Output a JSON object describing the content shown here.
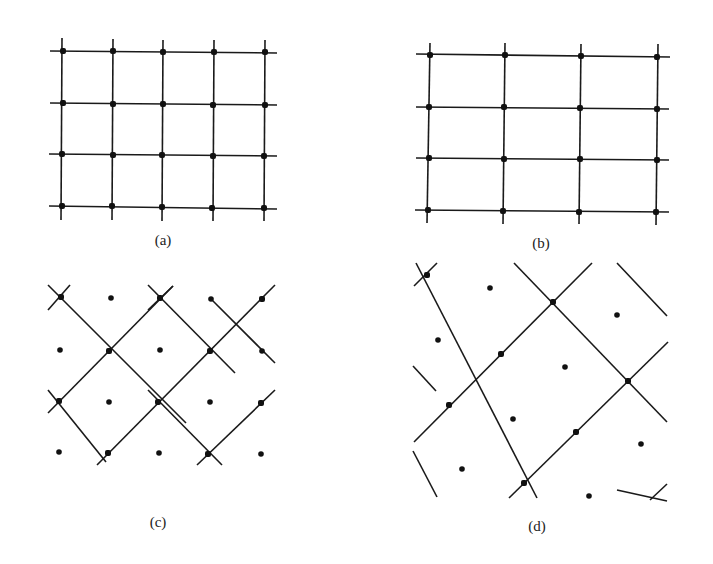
{
  "figure": {
    "background": "#ffffff",
    "ink_color": "#111111",
    "panels": [
      {
        "id": "a",
        "label": "(a)",
        "label_pos": [
          163,
          245
        ],
        "description": "Rectangular lattice, 5 columns x 4 rows",
        "lines": [
          [
            50,
            51,
            277,
            53
          ],
          [
            50,
            103,
            277,
            105
          ],
          [
            49,
            154,
            277,
            156
          ],
          [
            49,
            206,
            277,
            209
          ],
          [
            62,
            38,
            61,
            220
          ],
          [
            113,
            39,
            112,
            220
          ],
          [
            163,
            40,
            162,
            221
          ],
          [
            214,
            40,
            213,
            221
          ],
          [
            265,
            40,
            264,
            221
          ]
        ],
        "lattice_points": [
          [
            63,
            51
          ],
          [
            113,
            51
          ],
          [
            163,
            52
          ],
          [
            214,
            52
          ],
          [
            265,
            52
          ],
          [
            63,
            103
          ],
          [
            113,
            104
          ],
          [
            163,
            104
          ],
          [
            213,
            105
          ],
          [
            265,
            105
          ],
          [
            62,
            154
          ],
          [
            113,
            155
          ],
          [
            162,
            155
          ],
          [
            213,
            156
          ],
          [
            264,
            156
          ],
          [
            62,
            206
          ],
          [
            112,
            206
          ],
          [
            162,
            207
          ],
          [
            212,
            208
          ],
          [
            264,
            208
          ]
        ],
        "center_dots": []
      },
      {
        "id": "b",
        "label": "(b)",
        "label_pos": [
          541,
          248
        ],
        "description": "Rectangular lattice, 4 columns x 4 rows (wider cells)",
        "lines": [
          [
            416,
            54,
            670,
            57
          ],
          [
            416,
            107,
            669,
            109
          ],
          [
            416,
            158,
            669,
            160
          ],
          [
            415,
            210,
            669,
            212
          ],
          [
            430,
            43,
            427,
            223
          ],
          [
            505,
            43,
            503,
            224
          ],
          [
            581,
            44,
            579,
            224
          ],
          [
            658,
            44,
            656,
            225
          ]
        ],
        "lattice_points": [
          [
            430,
            55
          ],
          [
            505,
            55
          ],
          [
            581,
            56
          ],
          [
            657,
            57
          ],
          [
            429,
            107
          ],
          [
            504,
            107
          ],
          [
            580,
            108
          ],
          [
            657,
            109
          ],
          [
            429,
            158
          ],
          [
            504,
            159
          ],
          [
            580,
            159
          ],
          [
            657,
            160
          ],
          [
            428,
            210
          ],
          [
            503,
            211
          ],
          [
            579,
            212
          ],
          [
            656,
            212
          ]
        ],
        "center_dots": []
      },
      {
        "id": "c",
        "label": "(c)",
        "label_pos": [
          158,
          527
        ],
        "description": "Centered lattice: diagonal (rotated square) lattice with additional points at cell centers",
        "lines": [
          [
            48,
            285,
            186,
            423
          ],
          [
            148,
            285,
            235,
            373
          ],
          [
            210,
            298,
            275,
            363
          ],
          [
            48,
            390,
            106,
            462
          ],
          [
            148,
            390,
            222,
            465
          ],
          [
            48,
            310,
            70,
            285
          ],
          [
            48,
            413,
            173,
            286
          ],
          [
            97,
            465,
            275,
            285
          ],
          [
            197,
            465,
            275,
            390
          ],
          [
            148,
            310,
            173,
            286
          ]
        ],
        "lattice_points": [
          [
            61,
            297
          ],
          [
            160,
            298
          ],
          [
            262,
            299
          ],
          [
            109,
            351
          ],
          [
            210,
            351
          ],
          [
            59,
            401
          ],
          [
            158,
            402
          ],
          [
            261,
            403
          ],
          [
            108,
            453
          ],
          [
            208,
            454
          ]
        ],
        "center_dots": [
          [
            111,
            298
          ],
          [
            211,
            299
          ],
          [
            60,
            350
          ],
          [
            160,
            350
          ],
          [
            262,
            351
          ],
          [
            109,
            402
          ],
          [
            210,
            402
          ],
          [
            59,
            452
          ],
          [
            159,
            453
          ],
          [
            261,
            454
          ]
        ]
      },
      {
        "id": "d",
        "label": "(d)",
        "label_pos": [
          537,
          531
        ],
        "description": "Rotated rectangular lattice with centered points (oblique diagonal lines)",
        "lines": [
          [
            416,
            263,
            537,
            498
          ],
          [
            514,
            263,
            667,
            422
          ],
          [
            617,
            263,
            667,
            316
          ],
          [
            413,
            366,
            436,
            391
          ],
          [
            413,
            451,
            437,
            497
          ],
          [
            617,
            490,
            667,
            501
          ],
          [
            414,
            286,
            437,
            263
          ],
          [
            414,
            442,
            592,
            263
          ],
          [
            509,
            498,
            668,
            342
          ],
          [
            650,
            500,
            667,
            484
          ]
        ],
        "lattice_points": [
          [
            427,
            275
          ],
          [
            553,
            302
          ],
          [
            501,
            354
          ],
          [
            628,
            381
          ],
          [
            449,
            405
          ],
          [
            576,
            432
          ],
          [
            524,
            483
          ]
        ],
        "center_dots": [
          [
            490,
            288
          ],
          [
            617,
            315
          ],
          [
            438,
            340
          ],
          [
            565,
            367
          ],
          [
            513,
            419
          ],
          [
            641,
            444
          ],
          [
            462,
            469
          ],
          [
            589,
            496
          ]
        ]
      }
    ]
  }
}
